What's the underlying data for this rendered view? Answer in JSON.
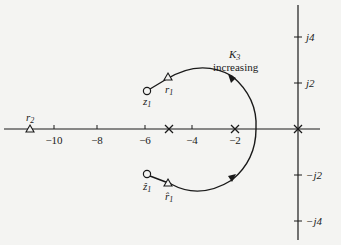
{
  "figure": {
    "type": "root-locus",
    "real_axis": {
      "ticks": [
        {
          "value": -10,
          "label": "−10",
          "x": 54
        },
        {
          "value": -8,
          "label": "−8",
          "x": 97
        },
        {
          "value": -6,
          "label": "−6",
          "x": 145
        },
        {
          "value": -4,
          "label": "−4",
          "x": 192
        },
        {
          "value": -2,
          "label": "−2",
          "x": 235
        }
      ]
    },
    "imag_axis": {
      "ticks": [
        {
          "value": 4,
          "label": "j4",
          "y": 37
        },
        {
          "value": 2,
          "label": "j2",
          "y": 83
        },
        {
          "value": -2,
          "label": "−j2",
          "y": 175
        },
        {
          "value": -4,
          "label": "−j4",
          "y": 221
        }
      ]
    },
    "poles": [
      {
        "label": "pole at -5",
        "x": 169,
        "y": 129
      },
      {
        "label": "pole at -2",
        "x": 235,
        "y": 129
      },
      {
        "label": "pole at 0",
        "x": 298,
        "y": 129
      }
    ],
    "zeros": [
      {
        "label": "z₁",
        "sub": "1",
        "base": "z",
        "x": 147,
        "y": 91
      },
      {
        "label": "ẑ₁",
        "sub": "1",
        "base": "ẑ",
        "x": 147,
        "y": 174
      }
    ],
    "roots": [
      {
        "label": "r₁",
        "base": "r",
        "sub": "1",
        "x": 168,
        "y": 77
      },
      {
        "label": "r̂₁",
        "base": "r̂",
        "sub": "1",
        "x": 168,
        "y": 183
      },
      {
        "label": "r₂",
        "base": "r",
        "sub": "2",
        "x": 30,
        "y": 129
      }
    ],
    "annotation": {
      "gain_symbol": "K",
      "gain_sub": "3",
      "text": "increasing"
    },
    "colors": {
      "line": "#1a1a1a",
      "background": "#f4f4f2"
    }
  }
}
